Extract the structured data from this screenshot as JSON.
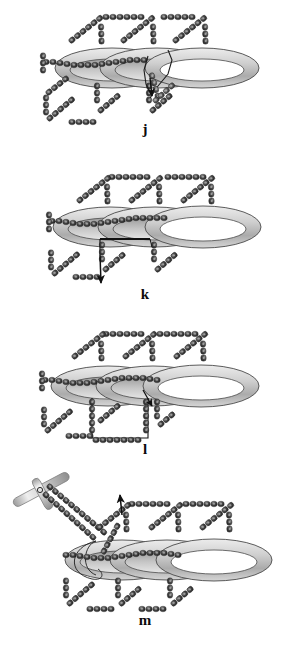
{
  "figure": {
    "caption_present": false,
    "background_color": "#ffffff",
    "width": 290,
    "height": 650,
    "panel_count": 4
  },
  "palette": {
    "bead_dark": "#3a3a3a",
    "bead_mid": "#4e4e4e",
    "bead_light": "#6e6e6e",
    "bead_highlight": "#8f8f8f",
    "bead_outline": "#1c1c1c",
    "ring_fill": "#c9c9c9",
    "ring_highlight": "#e8e8e8",
    "ring_shadow": "#9a9a9a",
    "ring_outline": "#4a4a4a",
    "rod_light": "#e2e2e2",
    "rod_mid": "#b5b5b5",
    "rod_dark": "#8c8c8c",
    "arrow_color": "#101010",
    "thread_color": "#2a2a2a",
    "label_color": "#0b0b0b"
  },
  "panels": [
    {
      "id": "panel-j",
      "label": "j",
      "label_y": 128,
      "top": 0,
      "height": 150,
      "rings": 3,
      "has_arrow": true,
      "arrow_direction": "down",
      "has_handle": false,
      "description": "bead-chain network threaded through three elliptical rings"
    },
    {
      "id": "panel-k",
      "label": "k",
      "label_y": 292,
      "top": 155,
      "height": 150,
      "rings": 3,
      "has_arrow": true,
      "arrow_direction": "down-left",
      "has_handle": false,
      "description": "network with chain pulled through, arrow at lower left"
    },
    {
      "id": "panel-l",
      "label": "l",
      "label_y": 442,
      "top": 310,
      "height": 150,
      "rings": 3,
      "has_arrow": true,
      "arrow_direction": "down-right",
      "has_handle": false,
      "description": "network with enlarged lower loop, small arrow at ring"
    },
    {
      "id": "panel-m",
      "label": "m",
      "label_y": 620,
      "top": 455,
      "height": 180,
      "rings": 3,
      "has_arrow": true,
      "arrow_direction": "up",
      "has_handle": true,
      "handle_shape": "T-bar",
      "description": "network with T-handle tool pulling two chains out to upper left, up arrow"
    }
  ]
}
